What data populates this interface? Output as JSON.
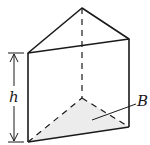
{
  "diagram": {
    "type": "triangular-prism",
    "labels": {
      "height": "h",
      "base": "B"
    },
    "colors": {
      "stroke": "#1a1a1a",
      "base_fill": "#ececec",
      "background": "#ffffff"
    }
  }
}
